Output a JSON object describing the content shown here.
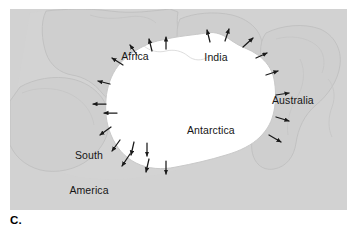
{
  "figure": {
    "panel_letter": "C.",
    "panel_background": "#d2d2d2",
    "landmass_fill": "#ffffff",
    "coastline_color": "#c2c2c2",
    "arrow_color": "#1a1a1a",
    "label_color": "#151515"
  },
  "map": {
    "labels": {
      "africa": "Africa",
      "india": "India",
      "australia": "Australia",
      "south_america": "South\nAmerica",
      "south_america_line1": "South",
      "south_america_line2": "America",
      "antarctica": "Antarctica"
    },
    "icons": {
      "flow_arrow": "flow-arrow-icon"
    },
    "arrows": [
      {
        "id": "arrow-n-1",
        "x1": 200,
        "y1": 33,
        "x2": 197,
        "y2": 21,
        "label": "outward ice flow north"
      },
      {
        "id": "arrow-n-2",
        "x1": 215,
        "y1": 32,
        "x2": 219,
        "y2": 20,
        "label": "outward ice flow north-northeast"
      },
      {
        "id": "arrow-n-3",
        "x1": 233,
        "y1": 38,
        "x2": 243,
        "y2": 29,
        "label": "outward ice flow northeast"
      },
      {
        "id": "arrow-ne-1",
        "x1": 246,
        "y1": 49,
        "x2": 257,
        "y2": 44,
        "label": "outward ice flow east-northeast"
      },
      {
        "id": "arrow-ne-2",
        "x1": 256,
        "y1": 66,
        "x2": 268,
        "y2": 62,
        "label": "outward ice flow east"
      },
      {
        "id": "arrow-e-1",
        "x1": 266,
        "y1": 86,
        "x2": 279,
        "y2": 84,
        "label": "outward ice flow east"
      },
      {
        "id": "arrow-e-2",
        "x1": 266,
        "y1": 108,
        "x2": 279,
        "y2": 112,
        "label": "outward ice flow east-southeast"
      },
      {
        "id": "arrow-e-3",
        "x1": 259,
        "y1": 126,
        "x2": 271,
        "y2": 133,
        "label": "outward ice flow southeast"
      },
      {
        "id": "arrow-nw-1",
        "x1": 127,
        "y1": 46,
        "x2": 120,
        "y2": 36,
        "label": "outward ice flow north-northwest"
      },
      {
        "id": "arrow-nw-2",
        "x1": 142,
        "y1": 42,
        "x2": 139,
        "y2": 30,
        "label": "outward ice flow north"
      },
      {
        "id": "arrow-nw-3",
        "x1": 156,
        "y1": 40,
        "x2": 156,
        "y2": 28,
        "label": "outward ice flow north"
      },
      {
        "id": "arrow-nw-4",
        "x1": 113,
        "y1": 56,
        "x2": 102,
        "y2": 49,
        "label": "outward ice flow northwest"
      },
      {
        "id": "arrow-w-1",
        "x1": 100,
        "y1": 75,
        "x2": 88,
        "y2": 72,
        "label": "outward ice flow west"
      },
      {
        "id": "arrow-w-2",
        "x1": 96,
        "y1": 95,
        "x2": 83,
        "y2": 95,
        "label": "outward ice flow west"
      },
      {
        "id": "arrow-sw-1",
        "x1": 101,
        "y1": 118,
        "x2": 90,
        "y2": 126,
        "label": "outward ice flow southwest"
      },
      {
        "id": "arrow-sw-2",
        "x1": 110,
        "y1": 131,
        "x2": 102,
        "y2": 142,
        "label": "outward ice flow southwest"
      },
      {
        "id": "arrow-s-1",
        "x1": 124,
        "y1": 133,
        "x2": 121,
        "y2": 146,
        "label": "outward ice flow south"
      },
      {
        "id": "arrow-s-2",
        "x1": 137,
        "y1": 134,
        "x2": 137,
        "y2": 147,
        "label": "outward ice flow south"
      },
      {
        "id": "arrow-s-3",
        "x1": 120,
        "y1": 145,
        "x2": 112,
        "y2": 157,
        "label": "outward ice flow south-southwest"
      },
      {
        "id": "arrow-s-4",
        "x1": 139,
        "y1": 150,
        "x2": 136,
        "y2": 163,
        "label": "outward ice flow south"
      },
      {
        "id": "arrow-s-5",
        "x1": 156,
        "y1": 152,
        "x2": 156,
        "y2": 165,
        "label": "outward ice flow south"
      },
      {
        "id": "arrow-sw-3",
        "x1": 107,
        "y1": 104,
        "x2": 94,
        "y2": 104,
        "label": "outward ice flow west"
      }
    ]
  }
}
